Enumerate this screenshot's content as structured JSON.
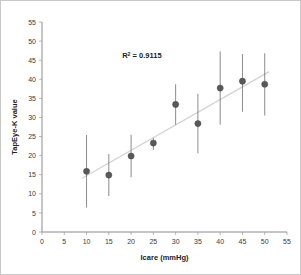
{
  "chart_data": {
    "type": "scatter",
    "title": "",
    "xlabel": "Icare (mmHg)",
    "ylabel": "TapEye-K value",
    "xlim": [
      0,
      55
    ],
    "ylim": [
      0,
      55
    ],
    "xticks": [
      0,
      5,
      10,
      15,
      20,
      25,
      30,
      35,
      40,
      45,
      50,
      55
    ],
    "yticks": [
      0,
      5,
      10,
      15,
      20,
      25,
      30,
      35,
      40,
      45,
      50,
      55
    ],
    "grid": false,
    "legend": "none",
    "annotations": [
      {
        "name": "r-squared",
        "prefix": "R",
        "superscript": "2",
        "suffix": " = 0.9115",
        "text": "R² = 0.9115",
        "x": 18,
        "y": 45.5
      }
    ],
    "x": [
      10,
      15,
      20,
      25,
      30,
      35,
      40,
      45,
      50
    ],
    "values": [
      15.9,
      14.9,
      19.9,
      23.3,
      33.4,
      28.4,
      37.7,
      39.5,
      38.7
    ],
    "error_low": [
      9.5,
      5.5,
      5.6,
      2.4,
      5.3,
      7.8,
      9.6,
      8.0,
      8.2
    ],
    "error_high": [
      9.5,
      5.5,
      5.6,
      2.4,
      5.3,
      7.8,
      9.6,
      8.0,
      8.2
    ],
    "points": [
      {
        "x": 10,
        "y": 15.9,
        "err_low": 6.4,
        "err_high": 25.4
      },
      {
        "x": 15,
        "y": 14.9,
        "err_low": 9.4,
        "err_high": 20.4
      },
      {
        "x": 20,
        "y": 19.9,
        "err_low": 14.3,
        "err_high": 25.5
      },
      {
        "x": 25,
        "y": 23.3,
        "err_low": 21.5,
        "err_high": 24.6
      },
      {
        "x": 30,
        "y": 33.4,
        "err_low": 28.1,
        "err_high": 38.7
      },
      {
        "x": 35,
        "y": 28.4,
        "err_low": 20.6,
        "err_high": 36.2
      },
      {
        "x": 40,
        "y": 37.7,
        "err_low": 28.1,
        "err_high": 47.3
      },
      {
        "x": 45,
        "y": 39.5,
        "err_low": 31.5,
        "err_high": 46.6
      },
      {
        "x": 50,
        "y": 38.7,
        "err_low": 30.5,
        "err_high": 46.8
      }
    ],
    "trendline": {
      "type": "linear",
      "x_start": 9,
      "y_start": 14.1,
      "x_end": 51,
      "y_end": 42.0,
      "r_squared": 0.9115
    },
    "colors": {
      "marker": "#595959",
      "errorbar": "#6e6e6e",
      "trendline": "#d2d2d2",
      "axis": "#8c8c8c",
      "text": "#222222",
      "border": "#c9c9c9"
    }
  }
}
